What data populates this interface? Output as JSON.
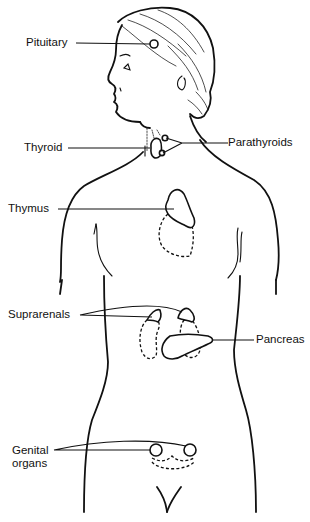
{
  "diagram": {
    "type": "anatomical-line-drawing",
    "colors": {
      "line": "#111111",
      "background": "#ffffff"
    },
    "labels": {
      "pituitary": "Pituitary",
      "thyroid": "Thyroid",
      "parathyroids": "Parathyroids",
      "thymus": "Thymus",
      "suprarenals": "Suprarenals",
      "pancreas": "Pancreas",
      "genital_organs": "Genital\norgans"
    }
  }
}
